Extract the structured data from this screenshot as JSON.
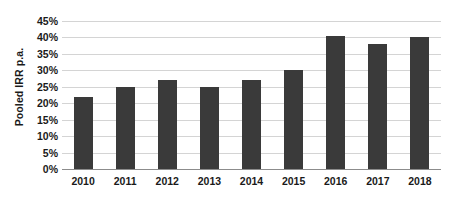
{
  "chart_data": {
    "type": "bar",
    "title": "",
    "subtitle": "",
    "xlabel": "",
    "ylabel": "Pooled IRR p.a.",
    "categories": [
      "2010",
      "2011",
      "2012",
      "2013",
      "2014",
      "2015",
      "2016",
      "2017",
      "2018"
    ],
    "values": [
      22,
      25,
      27,
      25,
      27,
      30,
      40.5,
      38,
      40
    ],
    "value_labels": [
      "22%",
      "25%",
      "27%",
      "25%",
      "27%",
      "30%",
      "40.5%",
      "38%",
      "40%"
    ],
    "ylim": [
      0,
      45
    ],
    "y_tick_values": [
      0,
      5,
      10,
      15,
      20,
      25,
      30,
      35,
      40,
      45
    ],
    "y_tick_labels": [
      "0%",
      "5%",
      "10%",
      "15%",
      "20%",
      "25%",
      "30%",
      "35%",
      "40%",
      "45%"
    ],
    "grid": true,
    "grid_axis": "y",
    "legend": false,
    "legend_position": "none",
    "series": [
      {
        "name": "Pooled IRR p.a.",
        "values": [
          22,
          25,
          27,
          25,
          27,
          30,
          40.5,
          38,
          40
        ]
      }
    ],
    "colors": {
      "bar": "#3a3a3a",
      "gridline": "#d4d4d4",
      "axis": "#8c8c8c",
      "text": "#1a1a1a",
      "background": "#ffffff"
    }
  }
}
